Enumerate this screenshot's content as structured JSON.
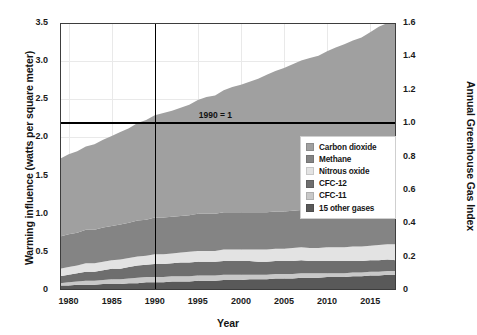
{
  "chart_data": {
    "type": "area",
    "stacked": true,
    "title": "",
    "xlabel": "Year",
    "ylabel": "Warming influence (watts per square meter)",
    "ylabel_right": "Annual Greenhouse Gas Index",
    "xlim": [
      1979,
      2018
    ],
    "ylim": [
      0,
      3.5
    ],
    "ylim_right": [
      0,
      1.6
    ],
    "grid": true,
    "legend_position": "inside-right",
    "xticks": [
      1980,
      1985,
      1990,
      1995,
      2000,
      2005,
      2010,
      2015
    ],
    "xtick_labels": [
      "1980",
      "1985",
      "1990",
      "1995",
      "2000",
      "2005",
      "2010",
      "2015"
    ],
    "yticks": [
      0,
      0.5,
      1.0,
      1.5,
      2.0,
      2.5,
      3.0,
      3.5
    ],
    "ytick_labels": [
      "0",
      "0.5",
      "1.0",
      "1.5",
      "2.0",
      "2.5",
      "3.0",
      "3.5"
    ],
    "yticks_right": [
      0,
      0.2,
      0.4,
      0.6,
      0.8,
      1.0,
      1.2,
      1.4,
      1.6
    ],
    "ytick_labels_right": [
      "0",
      "0.2",
      "0.4",
      "0.6",
      "0.8",
      "1.0",
      "1.2",
      "1.4",
      "1.6"
    ],
    "annotations": [
      {
        "text": "1990 = 1",
        "x": 1990,
        "y": 2.2
      }
    ],
    "reference_lines": [
      {
        "orientation": "vertical",
        "value": 1990,
        "color": "#000000"
      },
      {
        "orientation": "horizontal",
        "value": 2.2,
        "color": "#000000"
      }
    ],
    "x": [
      1979,
      1980,
      1981,
      1982,
      1983,
      1984,
      1985,
      1986,
      1987,
      1988,
      1989,
      1990,
      1991,
      1992,
      1993,
      1994,
      1995,
      1996,
      1997,
      1998,
      1999,
      2000,
      2001,
      2002,
      2003,
      2004,
      2005,
      2006,
      2007,
      2008,
      2009,
      2010,
      2011,
      2012,
      2013,
      2014,
      2015,
      2016,
      2017,
      2018
    ],
    "series": [
      {
        "name": "15 other gases",
        "color": "#595959",
        "order": 1,
        "values": [
          0.06,
          0.06,
          0.07,
          0.07,
          0.07,
          0.08,
          0.08,
          0.08,
          0.09,
          0.09,
          0.1,
          0.1,
          0.1,
          0.11,
          0.11,
          0.11,
          0.12,
          0.12,
          0.12,
          0.13,
          0.13,
          0.13,
          0.14,
          0.14,
          0.14,
          0.15,
          0.15,
          0.15,
          0.16,
          0.16,
          0.16,
          0.17,
          0.17,
          0.17,
          0.18,
          0.18,
          0.19,
          0.19,
          0.2,
          0.2
        ]
      },
      {
        "name": "CFC-11",
        "color": "#c8c8c8",
        "order": 2,
        "values": [
          0.03,
          0.04,
          0.04,
          0.05,
          0.05,
          0.05,
          0.06,
          0.06,
          0.06,
          0.07,
          0.07,
          0.07,
          0.07,
          0.07,
          0.07,
          0.07,
          0.07,
          0.07,
          0.07,
          0.07,
          0.07,
          0.07,
          0.06,
          0.06,
          0.06,
          0.06,
          0.06,
          0.06,
          0.06,
          0.06,
          0.06,
          0.05,
          0.05,
          0.05,
          0.05,
          0.05,
          0.05,
          0.05,
          0.05,
          0.05
        ]
      },
      {
        "name": "CFC-12",
        "color": "#6e6e6e",
        "order": 3,
        "values": [
          0.09,
          0.1,
          0.11,
          0.12,
          0.12,
          0.13,
          0.14,
          0.14,
          0.15,
          0.16,
          0.16,
          0.17,
          0.17,
          0.17,
          0.18,
          0.18,
          0.18,
          0.18,
          0.18,
          0.18,
          0.18,
          0.18,
          0.18,
          0.17,
          0.17,
          0.17,
          0.17,
          0.17,
          0.17,
          0.16,
          0.16,
          0.16,
          0.16,
          0.16,
          0.15,
          0.15,
          0.15,
          0.15,
          0.15,
          0.14
        ]
      },
      {
        "name": "Nitrous oxide",
        "color": "#e3e3e3",
        "order": 4,
        "values": [
          0.1,
          0.1,
          0.1,
          0.11,
          0.11,
          0.11,
          0.11,
          0.12,
          0.12,
          0.12,
          0.12,
          0.13,
          0.13,
          0.13,
          0.13,
          0.14,
          0.14,
          0.14,
          0.14,
          0.15,
          0.15,
          0.15,
          0.15,
          0.16,
          0.16,
          0.16,
          0.16,
          0.17,
          0.17,
          0.17,
          0.17,
          0.18,
          0.18,
          0.18,
          0.19,
          0.19,
          0.19,
          0.2,
          0.2,
          0.21
        ]
      },
      {
        "name": "Methane",
        "color": "#848484",
        "order": 5,
        "values": [
          0.42,
          0.43,
          0.43,
          0.44,
          0.44,
          0.45,
          0.45,
          0.46,
          0.46,
          0.47,
          0.47,
          0.48,
          0.48,
          0.48,
          0.48,
          0.48,
          0.49,
          0.49,
          0.49,
          0.49,
          0.49,
          0.49,
          0.49,
          0.49,
          0.49,
          0.49,
          0.49,
          0.49,
          0.49,
          0.49,
          0.49,
          0.49,
          0.5,
          0.5,
          0.5,
          0.5,
          0.51,
          0.51,
          0.51,
          0.51
        ]
      },
      {
        "name": "Carbon dioxide",
        "color": "#a0a0a0",
        "order": 6,
        "values": [
          1.02,
          1.05,
          1.07,
          1.09,
          1.12,
          1.15,
          1.18,
          1.21,
          1.24,
          1.28,
          1.31,
          1.34,
          1.37,
          1.39,
          1.42,
          1.45,
          1.49,
          1.53,
          1.55,
          1.6,
          1.64,
          1.67,
          1.71,
          1.75,
          1.8,
          1.84,
          1.88,
          1.92,
          1.96,
          2.0,
          2.03,
          2.08,
          2.12,
          2.16,
          2.2,
          2.24,
          2.29,
          2.35,
          2.39,
          2.43
        ]
      }
    ],
    "legend_entries": [
      {
        "label": "Carbon dioxide",
        "color": "#a0a0a0"
      },
      {
        "label": "Methane",
        "color": "#848484"
      },
      {
        "label": "Nitrous oxide",
        "color": "#e3e3e3"
      },
      {
        "label": "CFC-12",
        "color": "#6e6e6e"
      },
      {
        "label": "CFC-11",
        "color": "#c8c8c8"
      },
      {
        "label": "15 other gases",
        "color": "#595959"
      }
    ]
  }
}
